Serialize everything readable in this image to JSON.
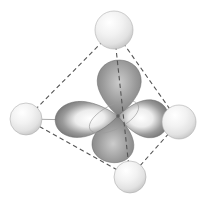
{
  "figure": {
    "title": "d orbital at the center of a tetrahedral arrangement of four atoms",
    "background": "#ffffff"
  },
  "canvas": {
    "width": 208,
    "height": 198
  },
  "colors": {
    "background": "#ffffff",
    "dashed_edge": "#555555",
    "solid_edge": "#aaaaaa",
    "lobe_edge": "#6a6a6a",
    "lobe_light": "#cccccc",
    "lobe_mid": "#9a9a9a",
    "lobe_dark": "#6e6e6e",
    "lobe_gloss_core": "#ffffff",
    "lobe_gloss_mid": "#ececec",
    "ring_stroke": "#9c9c9c",
    "sphere_core": "#ffffff",
    "sphere_mid": "#f2f2f2",
    "sphere_shade": "#e2e2e2",
    "sphere_edge": "#bcbcbc",
    "sphere_outline": "#aeaeae",
    "center_dot": "#5f5f5f"
  },
  "dash_pattern": "4.5 3.2",
  "spheres": [
    {
      "name": "atom-top",
      "cx": 114,
      "cy": 30,
      "r": 19
    },
    {
      "name": "atom-left",
      "cx": 26,
      "cy": 119,
      "r": 16
    },
    {
      "name": "atom-right",
      "cx": 179,
      "cy": 122,
      "r": 17
    },
    {
      "name": "atom-bottom",
      "cx": 130,
      "cy": 177,
      "r": 16
    }
  ],
  "edges": [
    {
      "name": "edge-top-left",
      "from": "atom-top",
      "to": "atom-left",
      "style": "dashed",
      "layer": "back"
    },
    {
      "name": "edge-top-right",
      "from": "atom-top",
      "to": "atom-right",
      "style": "dashed",
      "layer": "back"
    },
    {
      "name": "edge-left-bottom",
      "from": "atom-left",
      "to": "atom-bottom",
      "style": "dashed",
      "layer": "back"
    },
    {
      "name": "edge-right-bottom",
      "from": "atom-right",
      "to": "atom-bottom",
      "style": "dashed",
      "layer": "back"
    },
    {
      "name": "edge-left-right",
      "from": "atom-left",
      "to": "atom-right",
      "style": "solid",
      "layer": "back"
    },
    {
      "name": "edge-top-bottom",
      "from": "atom-top",
      "to": "atom-bottom",
      "style": "dashed",
      "layer": "front"
    }
  ],
  "orbital": {
    "center": {
      "x": 118,
      "y": 116
    },
    "lobes": [
      {
        "name": "lobe-up",
        "angle": 2,
        "length": 56,
        "width": 22,
        "finish": "matte"
      },
      {
        "name": "lobe-down",
        "angle": 190,
        "length": 47,
        "width": 21,
        "finish": "matte"
      },
      {
        "name": "lobe-left",
        "angle": 265,
        "length": 63,
        "width": 18,
        "finish": "gloss"
      },
      {
        "name": "lobe-right",
        "angle": 95,
        "length": 51,
        "width": 19,
        "finish": "gloss"
      }
    ],
    "node_ring": {
      "cx": 114,
      "cy": 117,
      "rx": 27,
      "ry": 12,
      "rotate": -27
    }
  }
}
